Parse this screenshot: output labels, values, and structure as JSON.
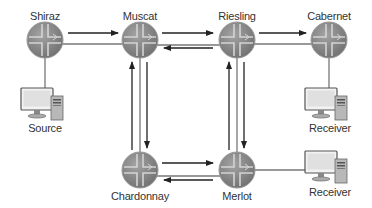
{
  "diagram": {
    "type": "network-topology",
    "routers": [
      {
        "id": "shiraz",
        "label": "Shiraz",
        "x": 45,
        "y": 40
      },
      {
        "id": "muscat",
        "label": "Muscat",
        "x": 140,
        "y": 40
      },
      {
        "id": "riesling",
        "label": "Riesling",
        "x": 237,
        "y": 40
      },
      {
        "id": "cabernet",
        "label": "Cabernet",
        "x": 329,
        "y": 40
      },
      {
        "id": "chardonnay",
        "label": "Chardonnay",
        "x": 140,
        "y": 170
      },
      {
        "id": "merlot",
        "label": "Merlot",
        "x": 237,
        "y": 170
      }
    ],
    "hosts": [
      {
        "id": "source",
        "label": "Source",
        "attached_to": "shiraz"
      },
      {
        "id": "receiver1",
        "label": "Receiver",
        "attached_to": "cabernet"
      },
      {
        "id": "receiver2",
        "label": "Receiver",
        "attached_to": "merlot"
      }
    ],
    "links": [
      {
        "from": "shiraz",
        "to": "muscat",
        "arrows": [
          "shiraz->muscat"
        ]
      },
      {
        "from": "muscat",
        "to": "riesling",
        "arrows": [
          "muscat->riesling",
          "riesling->muscat"
        ]
      },
      {
        "from": "riesling",
        "to": "cabernet",
        "arrows": [
          "riesling->cabernet"
        ]
      },
      {
        "from": "muscat",
        "to": "chardonnay",
        "arrows": [
          "chardonnay->muscat",
          "muscat->chardonnay"
        ]
      },
      {
        "from": "riesling",
        "to": "merlot",
        "arrows": [
          "merlot->riesling",
          "riesling->merlot"
        ]
      },
      {
        "from": "chardonnay",
        "to": "merlot",
        "arrows": [
          "chardonnay->merlot",
          "merlot->chardonnay"
        ]
      }
    ]
  },
  "labels": {
    "shiraz": "Shiraz",
    "muscat": "Muscat",
    "riesling": "Riesling",
    "cabernet": "Cabernet",
    "chardonnay": "Chardonnay",
    "merlot": "Merlot",
    "source": "Source",
    "receiver1": "Receiver",
    "receiver2": "Receiver"
  },
  "colors": {
    "router_fill": "#8c8c8c",
    "router_cross": "#c8c8c8",
    "link": "#777777",
    "arrow": "#222222"
  }
}
